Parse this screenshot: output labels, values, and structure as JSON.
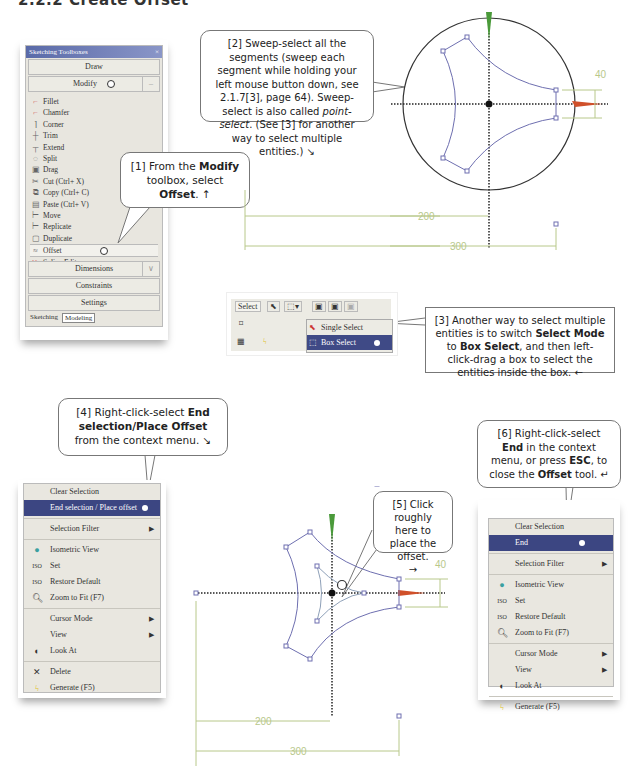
{
  "page_title": "2.2.2 Create Offset",
  "toolbox": {
    "title": "Sketching Toolboxes",
    "sections": {
      "draw": "Draw",
      "modify": "Modify",
      "dimensions": "Dimensions",
      "constraints": "Constraints",
      "settings": "Settings"
    },
    "items": [
      {
        "label": "Fillet",
        "icon": "fillet-icon"
      },
      {
        "label": "Chamfer",
        "icon": "chamfer-icon"
      },
      {
        "label": "Corner",
        "icon": "corner-icon"
      },
      {
        "label": "Trim",
        "icon": "trim-icon"
      },
      {
        "label": "Extend",
        "icon": "extend-icon"
      },
      {
        "label": "Split",
        "icon": "split-icon"
      },
      {
        "label": "Drag",
        "icon": "drag-icon"
      },
      {
        "label": "Cut (Ctrl+ X)",
        "icon": "cut-icon"
      },
      {
        "label": "Copy (Ctrl+ C)",
        "icon": "copy-icon"
      },
      {
        "label": "Paste (Ctrl+ V)",
        "icon": "paste-icon"
      },
      {
        "label": "Move",
        "icon": "move-icon"
      },
      {
        "label": "Replicate",
        "icon": "replicate-icon"
      },
      {
        "label": "Duplicate",
        "icon": "duplicate-icon"
      },
      {
        "label": "Offset",
        "icon": "offset-icon"
      },
      {
        "label": "Spline Edit",
        "icon": "spline-edit-icon"
      }
    ],
    "tabs": [
      "Sketching",
      "Modeling"
    ]
  },
  "callouts": {
    "c1": {
      "pre": "[1] From the ",
      "b1": "Modify",
      "mid": " toolbox, select ",
      "b2": "Offset",
      ". ": "",
      "post": ". ↑"
    },
    "c2": {
      "line1": "[2] Sweep-select all the segments (sweep each segment while holding your left mouse button down, see 2.1.7[3], page 64). Sweep-select is also called ",
      "italic": "point-select",
      ". ": "",
      "post": ". (See [3] for another way to select multiple entities.) ↘"
    },
    "c3": {
      "pre": "[3] Another way to select multiple entities is to switch ",
      "b1": "Select Mode",
      "mid": " to ",
      "b2": "Box Select",
      "post": ", and then left-click-drag a box to select the entities inside the box. ←"
    },
    "c4": {
      "pre": "[4] Right-click-select ",
      "b1": "End selection/Place Offset",
      "post": " from the context menu. ↘"
    },
    "c5": {
      "text": "[5] Click roughly here to place the offset.",
      "arrow": "→"
    },
    "c6": {
      "pre": "[6] Right-click-select ",
      "b1": "End",
      "mid": " in the context menu, or press ",
      "b2": "ESC",
      "mid2": ", to close the ",
      "b3": "Offset",
      "post": " tool. ↵"
    }
  },
  "select_toolbar": {
    "label": "Select",
    "options": [
      "Single Select",
      "Box Select"
    ],
    "selected": "Box Select"
  },
  "context_menu_1": {
    "items": [
      {
        "label": "Clear Selection"
      },
      {
        "label": "End selection / Place offset",
        "highlighted": true
      },
      {
        "label": "Selection Filter",
        "submenu": true
      },
      {
        "label": "Isometric View",
        "icon": "isometric-icon"
      },
      {
        "label": "Set",
        "icon": "iso-set-icon"
      },
      {
        "label": "Restore Default",
        "icon": "iso-restore-icon"
      },
      {
        "label": "Zoom to Fit (F7)",
        "icon": "zoom-fit-icon"
      },
      {
        "label": "Cursor Mode",
        "submenu": true
      },
      {
        "label": "View",
        "submenu": true
      },
      {
        "label": "Look At",
        "icon": "look-at-icon"
      },
      {
        "label": "Delete",
        "icon": "delete-icon"
      },
      {
        "label": "Generate (F5)",
        "icon": "generate-icon"
      }
    ]
  },
  "context_menu_2": {
    "items": [
      {
        "label": "Clear Selection"
      },
      {
        "label": "End",
        "highlighted": true
      },
      {
        "label": "Selection Filter",
        "submenu": true
      },
      {
        "label": "Isometric View",
        "icon": "isometric-icon"
      },
      {
        "label": "Set",
        "icon": "iso-set-icon"
      },
      {
        "label": "Restore Default",
        "icon": "iso-restore-icon"
      },
      {
        "label": "Zoom to Fit (F7)",
        "icon": "zoom-fit-icon"
      },
      {
        "label": "Cursor Mode",
        "submenu": true
      },
      {
        "label": "View",
        "submenu": true
      },
      {
        "label": "Look At",
        "icon": "look-at-icon"
      },
      {
        "label": "Generate (F5)",
        "icon": "generate-icon"
      }
    ]
  },
  "sketch_top": {
    "dims": {
      "d40": "40",
      "d200": "200",
      "d300": "300"
    }
  },
  "sketch_bottom": {
    "dims": {
      "d40": "40",
      "d200": "200",
      "d300": "300"
    }
  },
  "colors": {
    "highlight": "#3c4682",
    "dim": "#b8c88a",
    "curve": "#6e6fb0",
    "axis": "#222",
    "y_axis_arrow": "#4a9a3a",
    "x_axis_arrow": "#d0502a"
  }
}
